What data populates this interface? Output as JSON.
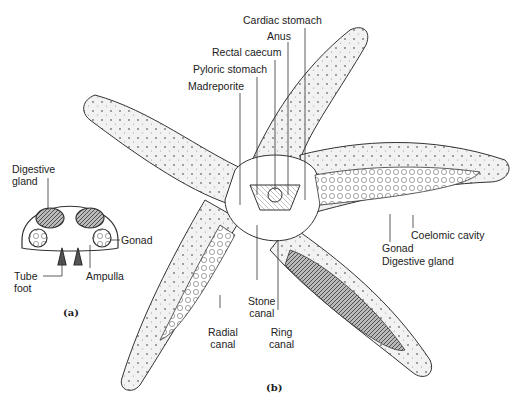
{
  "figure": {
    "panel_a": {
      "tag": "(a)",
      "labels": {
        "digestive_gland": "Digestive gland",
        "digestive_gland_l1": "Digestive",
        "digestive_gland_l2": "gland",
        "gonad": "Gonad",
        "tube_foot_l1": "Tube",
        "tube_foot_l2": "foot",
        "ampulla": "Ampulla"
      }
    },
    "panel_b": {
      "tag": "(b)",
      "labels": {
        "cardiac_stomach": "Cardiac stomach",
        "anus": "Anus",
        "rectal_caecum": "Rectal caecum",
        "pyloric_stomach": "Pyloric stomach",
        "madreporite": "Madreporite",
        "coelomic_cavity": "Coelomic cavity",
        "gonad": "Gonad",
        "digestive_gland": "Digestive gland",
        "stone_canal_l1": "Stone",
        "stone_canal_l2": "canal",
        "radial_canal_l1": "Radial",
        "radial_canal_l2": "canal",
        "ring_canal_l1": "Ring",
        "ring_canal_l2": "canal"
      }
    },
    "colors": {
      "ink": "#222222",
      "background": "#ffffff",
      "stipple": "#e6e6e6"
    }
  }
}
